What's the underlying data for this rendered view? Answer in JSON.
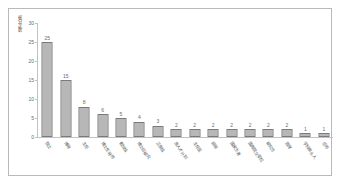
{
  "chart_data": {
    "type": "bar",
    "title": "",
    "xlabel": "",
    "ylabel": "被分次数",
    "ylim": [
      0,
      30
    ],
    "yticks": [
      0,
      5,
      10,
      15,
      20,
      25,
      30
    ],
    "grid": false,
    "legend": false,
    "bar_color": "#6e6e6e",
    "bar_pattern": "checkerboard",
    "categories": [
      "院士",
      "博导",
      "主任",
      "博士生导师",
      "教授级",
      "博士后研究",
      "正高级",
      "高人才计划",
      "主任医",
      "硕导",
      "国家杰青",
      "国务院文职位",
      "研究员",
      "首席",
      "学科带头人",
      "总师"
    ],
    "values": [
      25,
      15,
      8,
      6,
      5,
      4,
      3,
      2,
      2,
      2,
      2,
      2,
      2,
      2,
      1,
      1
    ]
  }
}
